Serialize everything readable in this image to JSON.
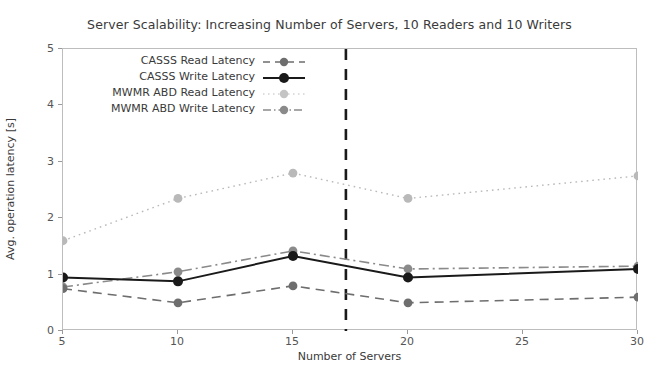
{
  "chart_data": {
    "type": "line",
    "title": "Server Scalability: Increasing Number of Servers, 10 Readers and 10 Writers",
    "xlabel": "Number of Servers",
    "ylabel": "Avg. operation latency [s]",
    "x": [
      5,
      10,
      15,
      20,
      30
    ],
    "xlim": [
      5,
      30
    ],
    "ylim": [
      0,
      5
    ],
    "xticks": [
      "5",
      "10",
      "15",
      "20",
      "25",
      "30"
    ],
    "xtick_values": [
      5,
      10,
      15,
      20,
      25,
      30
    ],
    "yticks": [
      "0",
      "1",
      "2",
      "3",
      "4",
      "5"
    ],
    "ytick_values": [
      0,
      1,
      2,
      3,
      4,
      5
    ],
    "grid": false,
    "legend_position": "upper left",
    "annotations": [
      {
        "name": "vertical-divider",
        "type": "vline",
        "x": 17.3,
        "style": "dashed",
        "color": "#1a1a1a"
      }
    ],
    "series": [
      {
        "name": "CASSS Read Latency",
        "values": [
          0.75,
          0.5,
          0.8,
          0.5,
          0.6
        ],
        "color": "#6e6e6e",
        "linestyle": "dashed",
        "marker": "circle"
      },
      {
        "name": "CASSS Write Latency",
        "values": [
          0.95,
          0.88,
          1.33,
          0.95,
          1.1
        ],
        "color": "#1a1a1a",
        "linestyle": "solid",
        "marker": "circle"
      },
      {
        "name": "MWMR ABD Read Latency",
        "values": [
          1.6,
          2.35,
          2.8,
          2.35,
          2.75
        ],
        "color": "#b9b9b9",
        "linestyle": "dotted",
        "marker": "circle"
      },
      {
        "name": "MWMR ABD Write Latency",
        "values": [
          0.78,
          1.05,
          1.42,
          1.1,
          1.15
        ],
        "color": "#8a8a8a",
        "linestyle": "dashdot",
        "marker": "circle"
      }
    ]
  },
  "legend": {
    "items": [
      {
        "label": "CASSS Read Latency"
      },
      {
        "label": "CASSS Write Latency"
      },
      {
        "label": "MWMR ABD Read Latency"
      },
      {
        "label": "MWMR ABD Write Latency"
      }
    ]
  }
}
